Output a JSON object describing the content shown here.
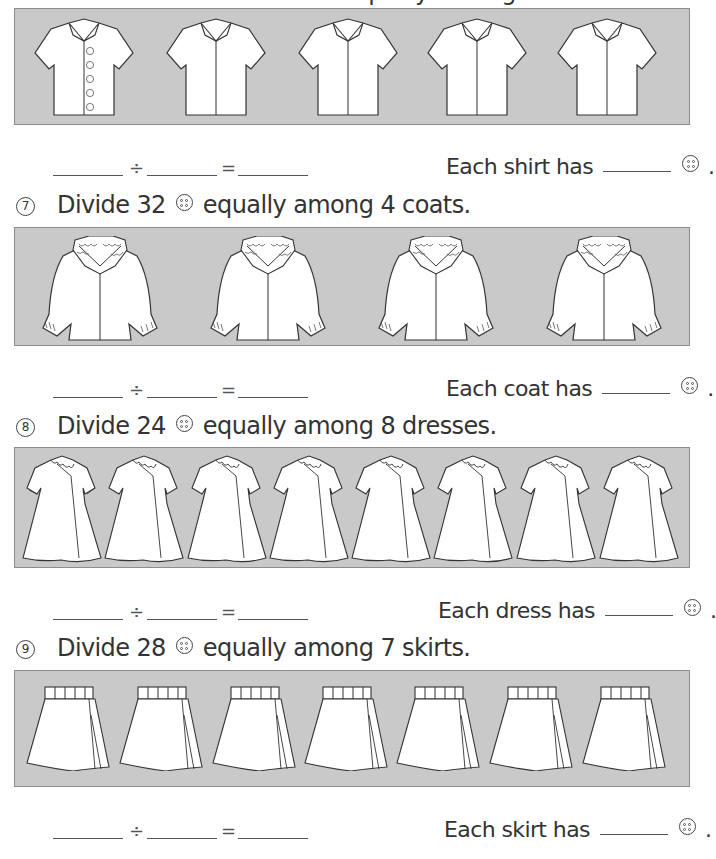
{
  "page": {
    "background": "#ffffff",
    "panel_color": "#c9c9c9",
    "panel_border": "#8d8d8d"
  },
  "problems": [
    {
      "id": "6",
      "number_glyph": "⑥",
      "heading": "Divide 20 buttons equally among 5 shirts.",
      "heading_visible": false,
      "item": "shirt",
      "item_count": 5,
      "first_item_buttons_shown": 5,
      "equation": {
        "dividend": "",
        "divide_sign": "÷",
        "divisor": "",
        "equals_sign": "=",
        "quotient": ""
      },
      "answer_prefix": "Each shirt has",
      "answer_blank": "",
      "answer_suffix": "."
    },
    {
      "id": "7",
      "number_glyph": "⑦",
      "heading_before": "Divide 32",
      "heading_after": "equally among 4 coats.",
      "item": "coat",
      "item_count": 4,
      "equation": {
        "dividend": "",
        "divide_sign": "÷",
        "divisor": "",
        "equals_sign": "=",
        "quotient": ""
      },
      "answer_prefix": "Each coat has",
      "answer_blank": "",
      "answer_suffix": "."
    },
    {
      "id": "8",
      "number_glyph": "⑧",
      "heading_before": "Divide 24",
      "heading_after": "equally among 8 dresses.",
      "item": "dress",
      "item_count": 8,
      "equation": {
        "dividend": "",
        "divide_sign": "÷",
        "divisor": "",
        "equals_sign": "=",
        "quotient": ""
      },
      "answer_prefix": "Each dress has",
      "answer_blank": "",
      "answer_suffix": "."
    },
    {
      "id": "9",
      "number_glyph": "⑨",
      "heading_before": "Divide 28",
      "heading_after": "equally among 7 skirts.",
      "item": "skirt",
      "item_count": 7,
      "equation": {
        "dividend": "",
        "divide_sign": "÷",
        "divisor": "",
        "equals_sign": "=",
        "quotient": ""
      },
      "answer_prefix": "Each skirt has",
      "answer_blank": "",
      "answer_suffix": "."
    }
  ],
  "icons": {
    "button": "button-icon (circle with four holes)"
  },
  "nums": {
    "n7": "7",
    "n8": "8",
    "n9": "9"
  }
}
